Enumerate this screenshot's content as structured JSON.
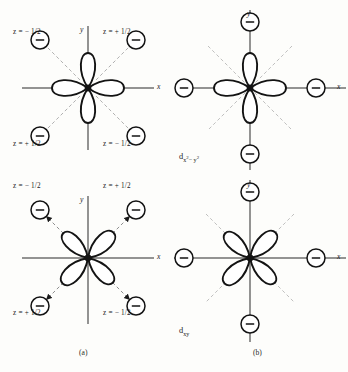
{
  "figure": {
    "background_color": "#fdfdfb",
    "ink_color": "#1a1a1a",
    "dash_color": "#9a9a9a"
  },
  "panels": [
    {
      "id": "top-left",
      "column_caption": "(a)",
      "orbital": "d(x2-y2)",
      "orbital_label_shown": false,
      "lobe_orientation": "along-axes",
      "charge_placement": "diagonal",
      "connector_style": "dashed-no-arrow",
      "axes": {
        "x_label": "x",
        "y_label": "y"
      },
      "charges": [
        {
          "position": "upper-left",
          "sign": "−",
          "label": "z = − 1/2"
        },
        {
          "position": "upper-right",
          "sign": "−",
          "label": "z = + 1/2"
        },
        {
          "position": "lower-left",
          "sign": "−",
          "label": "z = + 1/2"
        },
        {
          "position": "lower-right",
          "sign": "−",
          "label": "z = − 1/2"
        }
      ]
    },
    {
      "id": "top-right",
      "column_caption": "(b)",
      "orbital": "d(x2-y2)",
      "orbital_label_shown": true,
      "orbital_label_base": "d",
      "orbital_label_sub_left": "x",
      "orbital_label_sub_exp_left": "2",
      "orbital_label_sub_mid": "− y",
      "orbital_label_sub_exp_right": "2",
      "lobe_orientation": "along-axes",
      "charge_placement": "on-axes",
      "connector_style": "solid-arrow-inward",
      "axes": {
        "x_label": "x",
        "y_label": "y"
      },
      "charges": [
        {
          "position": "top",
          "sign": "−",
          "label": ""
        },
        {
          "position": "right",
          "sign": "−",
          "label": ""
        },
        {
          "position": "bottom",
          "sign": "−",
          "label": ""
        },
        {
          "position": "left",
          "sign": "−",
          "label": ""
        }
      ]
    },
    {
      "id": "bottom-left",
      "column_caption": "(a)",
      "orbital": "d(xy)",
      "orbital_label_shown": false,
      "lobe_orientation": "diagonal",
      "charge_placement": "diagonal",
      "connector_style": "dashed-arrow-outward",
      "axes": {
        "x_label": "x",
        "y_label": "y"
      },
      "charges": [
        {
          "position": "upper-left",
          "sign": "−",
          "label": "z = − 1/2"
        },
        {
          "position": "upper-right",
          "sign": "−",
          "label": "z = + 1/2"
        },
        {
          "position": "lower-left",
          "sign": "−",
          "label": "z = + 1/2"
        },
        {
          "position": "lower-right",
          "sign": "−",
          "label": "z = − 1/2"
        }
      ]
    },
    {
      "id": "bottom-right",
      "column_caption": "(b)",
      "orbital": "d(xy)",
      "orbital_label_shown": true,
      "orbital_label_base": "d",
      "orbital_label_sub": "xy",
      "lobe_orientation": "diagonal",
      "charge_placement": "on-axes",
      "connector_style": "solid-plain",
      "axes": {
        "x_label": "x",
        "y_label": "y"
      },
      "charges": [
        {
          "position": "top",
          "sign": "−",
          "label": ""
        },
        {
          "position": "right",
          "sign": "−",
          "label": ""
        },
        {
          "position": "bottom",
          "sign": "−",
          "label": ""
        },
        {
          "position": "left",
          "sign": "−",
          "label": ""
        }
      ]
    }
  ],
  "captions": {
    "left_column": "(a)",
    "right_column": "(b)"
  }
}
